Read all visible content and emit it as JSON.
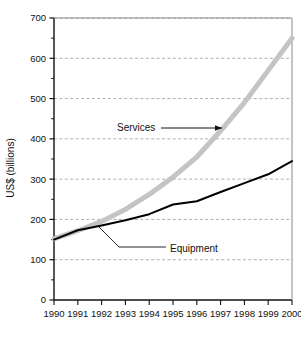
{
  "chart_data": {
    "type": "line",
    "title": "",
    "xlabel": "",
    "ylabel": "US$ (billions)",
    "x": [
      1990,
      1991,
      1992,
      1993,
      1994,
      1995,
      1996,
      1997,
      1998,
      1999,
      2000
    ],
    "xtick_labels": [
      "1990",
      "1991",
      "1992",
      "1993",
      "1994",
      "1995",
      "1996",
      "1997",
      "1998",
      "1999",
      "2000"
    ],
    "ytick_labels": [
      "0",
      "100",
      "200",
      "300",
      "400",
      "500",
      "600",
      "700"
    ],
    "yticks": [
      0,
      100,
      200,
      300,
      400,
      500,
      600,
      700
    ],
    "ylim": [
      0,
      700
    ],
    "xlim": [
      1990,
      2000
    ],
    "grid": "horizontal-dashed",
    "legend": "none-inline-annotations",
    "series": [
      {
        "name": "Services",
        "color": "#c4c4c4",
        "line_width": 5,
        "values": [
          152,
          172,
          195,
          225,
          262,
          305,
          355,
          420,
          490,
          570,
          650
        ]
      },
      {
        "name": "Equipment",
        "color": "#000000",
        "line_width": 2,
        "values": [
          150,
          173,
          185,
          198,
          213,
          237,
          245,
          268,
          290,
          312,
          345
        ]
      }
    ],
    "annotations": [
      {
        "label": "Services",
        "type": "leader-arrow",
        "points_to_year": 1997
      },
      {
        "label": "Equipment",
        "type": "leader-line",
        "points_to_year": 1992
      }
    ]
  }
}
